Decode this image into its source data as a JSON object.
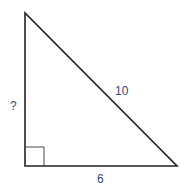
{
  "diagram": {
    "type": "right-triangle",
    "vertices": {
      "top": [
        25,
        13
      ],
      "right_angle": [
        25,
        166
      ],
      "bottom_right": [
        177,
        166
      ]
    },
    "right_angle_marker_size": 19,
    "labels": {
      "vertical_leg": "?",
      "hypotenuse": "10",
      "horizontal_leg": "6"
    },
    "colors": {
      "line": "#222222",
      "label": "#35477a"
    }
  }
}
